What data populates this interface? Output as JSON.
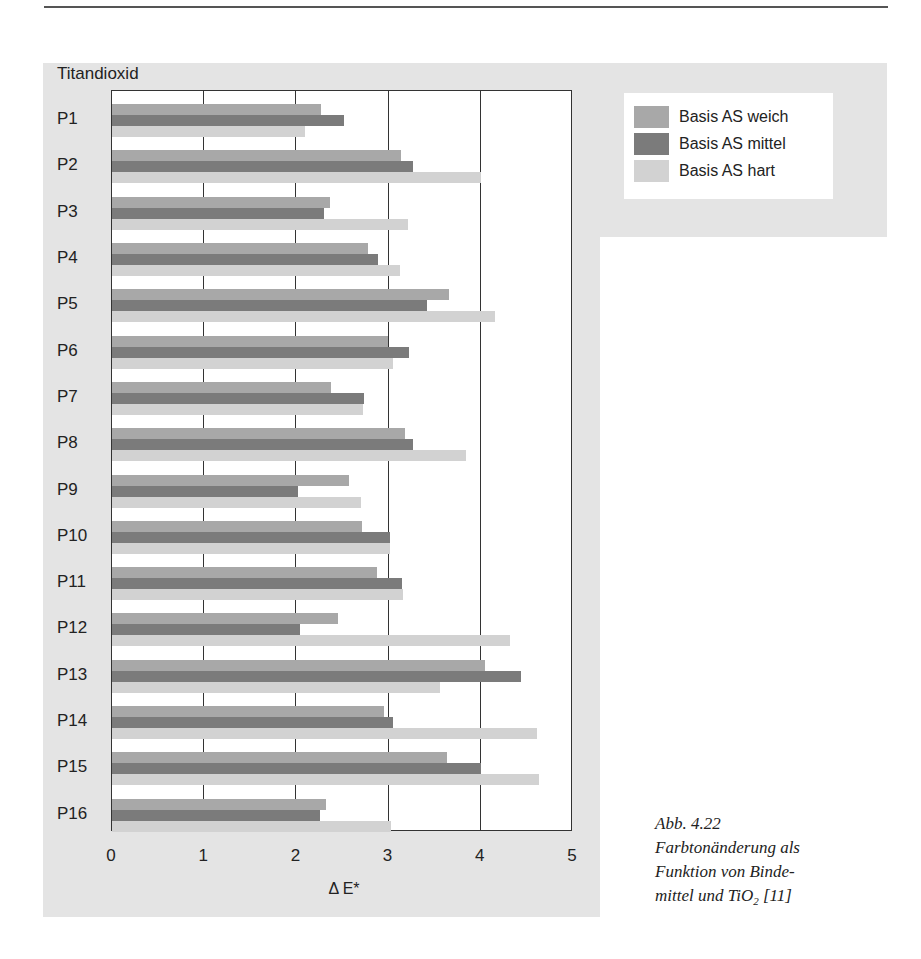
{
  "chart_data": {
    "type": "bar",
    "orientation": "horizontal",
    "title": "Titandioxid",
    "xlabel": "Δ E*",
    "ylabel": "",
    "xlim": [
      0,
      5
    ],
    "x_ticks": [
      "0",
      "1",
      "2",
      "3",
      "4",
      "5"
    ],
    "grid": true,
    "legend_position": "top-right",
    "categories": [
      "P1",
      "P2",
      "P3",
      "P4",
      "P5",
      "P6",
      "P7",
      "P8",
      "P9",
      "P10",
      "P11",
      "P12",
      "P13",
      "P14",
      "P15",
      "P16"
    ],
    "series": [
      {
        "name": "Basis AS weich",
        "color": "#a8a8a8",
        "values": [
          2.27,
          3.13,
          2.36,
          2.78,
          3.66,
          2.99,
          2.37,
          3.18,
          2.57,
          2.71,
          2.87,
          2.45,
          4.05,
          2.95,
          3.63,
          2.32
        ]
      },
      {
        "name": "Basis AS mittel",
        "color": "#7b7b7b",
        "values": [
          2.52,
          3.26,
          2.3,
          2.89,
          3.42,
          3.22,
          2.73,
          3.27,
          2.02,
          3.02,
          3.15,
          2.04,
          4.44,
          3.05,
          4.0,
          2.26
        ]
      },
      {
        "name": "Basis AS hart",
        "color": "#d2d2d2",
        "values": [
          2.09,
          4.0,
          3.21,
          3.12,
          4.15,
          3.05,
          2.72,
          3.84,
          2.7,
          3.02,
          3.16,
          4.32,
          3.56,
          4.61,
          4.63,
          3.03
        ]
      }
    ]
  },
  "caption": {
    "line1": "Abb. 4.22",
    "line2": "Farbtonänderung als",
    "line3": "Funktion von  Binde-",
    "line4_pre": "mittel und TiO",
    "line4_sub": "2",
    "line4_post": " [11]"
  }
}
